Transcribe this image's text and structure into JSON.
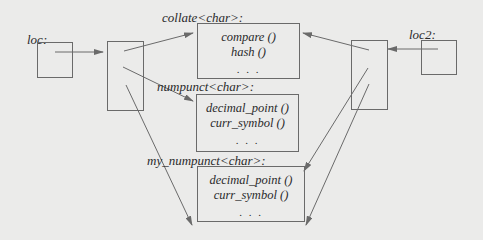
{
  "locales": {
    "loc": {
      "label": "loc:"
    },
    "loc2": {
      "label": "loc2:"
    }
  },
  "facets": [
    {
      "label": "collate<char>:",
      "members": [
        "compare ()",
        "hash ()"
      ],
      "ellipsis": ". . ."
    },
    {
      "label": "numpunct<char>:",
      "members": [
        "decimal_point ()",
        "curr_symbol ()"
      ],
      "ellipsis": ". . ."
    },
    {
      "label": "my_numpunct<char>:",
      "members": [
        "decimal_point ()",
        "curr_symbol ()"
      ],
      "ellipsis": ". . ."
    }
  ],
  "colors": {
    "background": "#ebebea",
    "line": "#6a6a6a",
    "text": "#2a2a2a"
  }
}
